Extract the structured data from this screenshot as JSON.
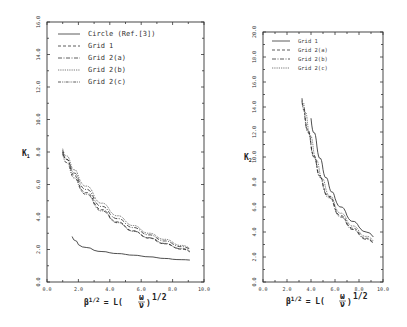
{
  "chart_data": [
    {
      "type": "line",
      "title": "",
      "xlabel": "β^1/2 = L(ω/ν)^1/2",
      "ylabel": "K1",
      "xlim": [
        0.0,
        10.0
      ],
      "ylim": [
        0.0,
        16.0
      ],
      "x_ticks": [
        "0.0",
        "2.0",
        "4.0",
        "6.0",
        "8.0",
        "10.0"
      ],
      "y_ticks": [
        "0.0",
        "2.0",
        "4.0",
        "6.0",
        "8.0",
        "10.0",
        "12.0",
        "14.0",
        "16.0"
      ],
      "grid": false,
      "legend_position": "upper left",
      "series": [
        {
          "name": "Circle (Ref.[3])",
          "style": "solid",
          "x": [
            1.6,
            2.0,
            3.0,
            4.0,
            5.0,
            6.0,
            7.0,
            8.0,
            9.1
          ],
          "y": [
            2.8,
            2.3,
            1.95,
            1.8,
            1.7,
            1.6,
            1.5,
            1.4,
            1.35
          ]
        },
        {
          "name": "Grid 1",
          "style": "dashed",
          "x": [
            1.0,
            1.5,
            2.0,
            3.0,
            4.0,
            5.0,
            6.0,
            7.0,
            8.0,
            9.1
          ],
          "y": [
            8.1,
            7.0,
            6.1,
            4.9,
            4.0,
            3.4,
            2.9,
            2.5,
            2.2,
            1.85
          ]
        },
        {
          "name": "Grid 2(a)",
          "style": "dash-dot",
          "x": [
            1.0,
            1.5,
            2.0,
            3.0,
            4.0,
            5.0,
            6.0,
            7.0,
            8.0,
            9.1
          ],
          "y": [
            8.0,
            7.1,
            6.3,
            5.1,
            4.2,
            3.6,
            3.1,
            2.7,
            2.35,
            2.0
          ]
        },
        {
          "name": "Grid 2(b)",
          "style": "dotted",
          "x": [
            1.0,
            1.5,
            2.0,
            3.0,
            4.0,
            5.0,
            6.0,
            7.0,
            8.0,
            9.1
          ],
          "y": [
            8.2,
            7.3,
            6.5,
            5.3,
            4.4,
            3.75,
            3.2,
            2.8,
            2.45,
            2.05
          ]
        },
        {
          "name": "Grid 2(c)",
          "style": "dash-dot-dot",
          "x": [
            1.0,
            1.5,
            2.0,
            3.0,
            4.0,
            5.0,
            6.0,
            7.0,
            8.0,
            9.1
          ],
          "y": [
            7.9,
            6.8,
            6.0,
            4.8,
            3.95,
            3.35,
            2.9,
            2.55,
            2.2,
            1.9
          ]
        }
      ]
    },
    {
      "type": "line",
      "title": "",
      "xlabel": "β^1/2 = L(ω/ν)^1/2",
      "ylabel": "K2",
      "xlim": [
        0.0,
        10.0
      ],
      "ylim": [
        0.0,
        20.0
      ],
      "x_ticks": [
        "0.0",
        "2.0",
        "4.0",
        "6.0",
        "8.0",
        "10.0"
      ],
      "y_ticks": [
        "0.0",
        "2.0",
        "4.0",
        "6.0",
        "8.0",
        "10.0",
        "12.0",
        "14.0",
        "16.0",
        "18.0",
        "20.0"
      ],
      "grid": false,
      "legend_position": "upper left",
      "series": [
        {
          "name": "Grid 1",
          "style": "solid",
          "x": [
            4.0,
            4.5,
            5.0,
            5.5,
            6.0,
            7.0,
            8.0,
            9.2
          ],
          "y": [
            13.1,
            10.8,
            9.0,
            7.7,
            6.7,
            5.3,
            4.4,
            3.6
          ]
        },
        {
          "name": "Grid 2(a)",
          "style": "dashed",
          "x": [
            3.25,
            3.5,
            4.0,
            4.5,
            5.0,
            6.0,
            7.0,
            8.0,
            9.2
          ],
          "y": [
            14.7,
            13.3,
            11.0,
            9.2,
            7.8,
            5.9,
            4.7,
            3.9,
            3.1
          ]
        },
        {
          "name": "Grid 2(b)",
          "style": "dash-dot",
          "x": [
            3.25,
            3.5,
            4.0,
            4.5,
            5.0,
            6.0,
            7.0,
            8.0,
            9.2
          ],
          "y": [
            14.5,
            13.1,
            10.9,
            9.1,
            7.7,
            5.8,
            4.6,
            3.8,
            3.05
          ]
        },
        {
          "name": "Grid 2(c)",
          "style": "dotted",
          "x": [
            3.4,
            3.7,
            4.2,
            4.7,
            5.2,
            6.0,
            7.0,
            8.0,
            9.2
          ],
          "y": [
            14.3,
            12.8,
            10.6,
            8.9,
            7.6,
            6.1,
            4.9,
            4.05,
            3.25
          ]
        }
      ]
    }
  ],
  "left": {
    "ylabel": "K",
    "ylabel_sub": "1",
    "xlabel_main": "β",
    "xlabel_sup": "1/2",
    "xlabel_eq": "= L(",
    "xlabel_frac_num": "ω",
    "xlabel_frac_den": "ν",
    "xlabel_close": ")",
    "xlabel_sup2": "1/2",
    "x_ticks": [
      "0.0",
      "2.0",
      "4.0",
      "6.0",
      "8.0",
      "10.0"
    ],
    "y_ticks": [
      "0.0",
      "2.0",
      "4.0",
      "6.0",
      "8.0",
      "10.0",
      "12.0",
      "14.0",
      "16.0"
    ],
    "legend": [
      "Circle (Ref.[3])",
      "Grid 1",
      "Grid 2(a)",
      "Grid 2(b)",
      "Grid 2(c)"
    ]
  },
  "right": {
    "ylabel": "K",
    "ylabel_sub": "2",
    "xlabel_main": "β",
    "xlabel_sup": "1/2",
    "xlabel_eq": "= L(",
    "xlabel_frac_num": "ω",
    "xlabel_frac_den": "ν",
    "xlabel_close": ")",
    "xlabel_sup2": "1/2",
    "x_ticks": [
      "0.0",
      "2.0",
      "4.0",
      "6.0",
      "8.0",
      "10.0"
    ],
    "y_ticks": [
      "0.0",
      "2.0",
      "4.0",
      "6.0",
      "8.0",
      "10.0",
      "12.0",
      "14.0",
      "16.0",
      "18.0",
      "20.0"
    ],
    "legend": [
      "Grid 1",
      "Grid 2(a)",
      "Grid 2(b)",
      "Grid 2(c)"
    ]
  }
}
